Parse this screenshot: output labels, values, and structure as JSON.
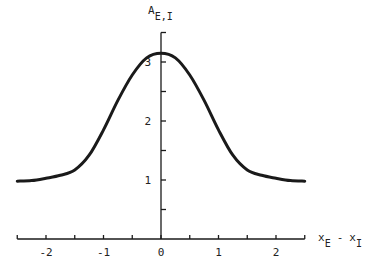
{
  "chart_data": {
    "type": "line",
    "title": "",
    "xlabel": "x_E - x_I",
    "ylabel": "A_E,I",
    "xlabel_parts": {
      "main1": "x",
      "sub1": "E",
      "sep": "-",
      "main2": "x",
      "sub2": "I"
    },
    "ylabel_parts": {
      "main": "A",
      "sub": "E,I"
    },
    "xlim": [
      -2.5,
      2.5
    ],
    "ylim": [
      0,
      3.5
    ],
    "x_ticks_major": [
      -2,
      -1,
      0,
      1,
      2
    ],
    "x_ticks_minor": [
      -2.5,
      -1.5,
      -0.5,
      0.5,
      1.5,
      2.5
    ],
    "x_tick_labels": [
      "-2",
      "-1",
      "0",
      "1",
      "2"
    ],
    "y_ticks_major": [
      1,
      2,
      3
    ],
    "y_ticks_minor": [
      0.5,
      1.5,
      2.5,
      3.5
    ],
    "y_tick_labels": [
      "1",
      "2",
      "3"
    ],
    "grid": false,
    "legend": null,
    "series": [
      {
        "name": "A_E,I",
        "color": "#1a1a1a",
        "x": [
          -2.5,
          -2.25,
          -2.0,
          -1.75,
          -1.5,
          -1.25,
          -1.0,
          -0.75,
          -0.5,
          -0.25,
          0.0,
          0.25,
          0.5,
          0.75,
          1.0,
          1.25,
          1.5,
          1.75,
          2.0,
          2.25,
          2.5
        ],
        "y": [
          0.98,
          0.99,
          1.03,
          1.08,
          1.17,
          1.42,
          1.85,
          2.35,
          2.78,
          3.07,
          3.15,
          3.07,
          2.78,
          2.35,
          1.85,
          1.42,
          1.17,
          1.08,
          1.03,
          0.99,
          0.98
        ]
      }
    ]
  }
}
